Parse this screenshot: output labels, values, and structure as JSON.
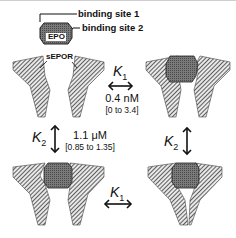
{
  "diagram": {
    "labels": {
      "binding_site_1": "binding site 1",
      "binding_site_2": "binding site 2",
      "epo": "EPO",
      "sepor": "sEPOR"
    },
    "constants": {
      "k1": {
        "symbol": "K",
        "subscript": "1",
        "value": "0.4 nM",
        "range": "[0 to 3.4]"
      },
      "k2": {
        "symbol": "K",
        "subscript": "2",
        "value": "1.1 μM",
        "range": "[0.85 to 1.35]"
      }
    },
    "states": [
      {
        "position": "top-left",
        "description": "EPO unbound, two sEPOR receptors apart"
      },
      {
        "position": "top-right",
        "description": "EPO bound to one sEPOR via site 1"
      },
      {
        "position": "bottom-left",
        "description": "EPO bound to one sEPOR via site 2"
      },
      {
        "position": "bottom-right",
        "description": "EPO bound by both sEPOR receptors (2:1 complex)"
      }
    ],
    "colors": {
      "hatch": "#555555",
      "epo_fill": "#6a6a6a",
      "epo_outline": "#222222",
      "border": "#cfcfcf"
    }
  }
}
